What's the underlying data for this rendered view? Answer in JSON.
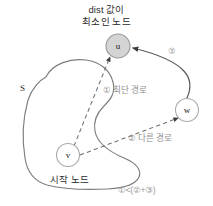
{
  "diagram": {
    "title_line1": "dist 값이",
    "title_line2": "최소인 노드",
    "set_label": "S",
    "start_label": "시작 노드",
    "formula": "①<(②+③)",
    "nodes": [
      {
        "id": "u",
        "label": "u",
        "cx": 118,
        "cy": 46,
        "r": 12,
        "fill": "#d4d4d4",
        "stroke": "#9a9a9a",
        "highlighted": true
      },
      {
        "id": "w",
        "label": "w",
        "cx": 187,
        "cy": 110,
        "r": 11.5,
        "fill": "#ffffff",
        "stroke": "#a8a8a8",
        "highlighted": false
      },
      {
        "id": "v",
        "label": "v",
        "cx": 68,
        "cy": 155,
        "r": 11.5,
        "fill": "#ffffff",
        "stroke": "#a8a8a8",
        "highlighted": false
      }
    ],
    "edges": [
      {
        "id": "edge-v-u",
        "from": "v",
        "to": "u",
        "style": "dashed",
        "label": "① 최단 경로",
        "marker": "arrow"
      },
      {
        "id": "edge-v-w",
        "from": "v",
        "to": "w",
        "style": "dashed",
        "label": "② 다른 경로",
        "marker": "arrow"
      },
      {
        "id": "edge-w-u",
        "from": "w",
        "to": "u",
        "style": "solid",
        "label": "③",
        "marker": "arrow"
      }
    ],
    "labels": {
      "path1": "① 최단 경로",
      "path2": "② 다른 경로",
      "path3": "③"
    },
    "colors": {
      "background": "#ffffff",
      "blob_stroke": "#7d7d7d",
      "dashed_stroke": "#7a7a7a",
      "solid_stroke": "#5a5a5a",
      "highlight_fill": "#d4d4d4",
      "text_primary": "#2b2b2b",
      "text_muted": "#9b9b9b"
    }
  }
}
